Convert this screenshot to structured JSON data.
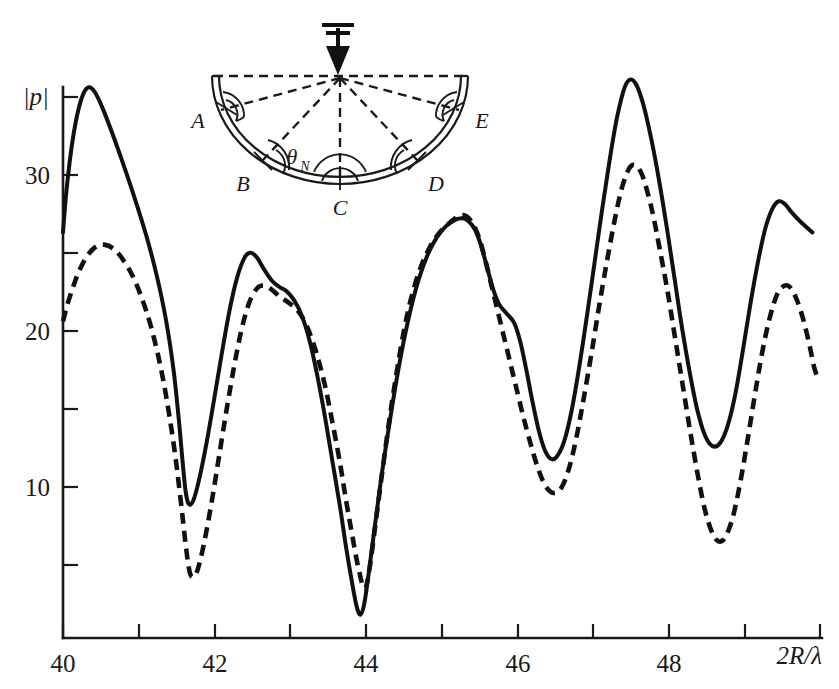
{
  "chart_data": {
    "type": "line",
    "title": "",
    "xlabel": "2R/λ",
    "ylabel": "|p|",
    "xlim": [
      40,
      50
    ],
    "ylim": [
      0,
      37
    ],
    "grid": false,
    "legend_position": "none",
    "x_ticks_major": [
      40,
      42,
      44,
      46,
      48
    ],
    "x_ticks_major_labels": [
      "40",
      "42",
      "44",
      "46",
      "48"
    ],
    "x_ticks_minor": [
      41,
      43,
      45,
      47,
      49,
      50
    ],
    "y_ticks_major": [
      10,
      20,
      30
    ],
    "y_ticks_major_labels": [
      "10",
      "20",
      "30"
    ],
    "y_ticks_minor": [
      5,
      15,
      25,
      35
    ],
    "series": [
      {
        "name": "solid",
        "style": "solid",
        "color": "#111111",
        "points": [
          [
            40.0,
            26.0
          ],
          [
            40.04,
            28.4
          ],
          [
            40.09,
            30.6
          ],
          [
            40.14,
            32.3
          ],
          [
            40.2,
            33.8
          ],
          [
            40.27,
            34.9
          ],
          [
            40.34,
            35.3
          ],
          [
            40.42,
            35.0
          ],
          [
            40.52,
            34.0
          ],
          [
            40.64,
            32.5
          ],
          [
            40.78,
            30.6
          ],
          [
            40.94,
            28.3
          ],
          [
            41.1,
            25.8
          ],
          [
            41.24,
            23.2
          ],
          [
            41.36,
            20.4
          ],
          [
            41.46,
            17.2
          ],
          [
            41.53,
            14.0
          ],
          [
            41.58,
            11.3
          ],
          [
            41.62,
            9.4
          ],
          [
            41.66,
            8.6
          ],
          [
            41.72,
            8.8
          ],
          [
            41.8,
            10.2
          ],
          [
            41.9,
            12.6
          ],
          [
            42.0,
            15.4
          ],
          [
            42.1,
            18.3
          ],
          [
            42.2,
            21.0
          ],
          [
            42.3,
            23.1
          ],
          [
            42.4,
            24.4
          ],
          [
            42.48,
            24.7
          ],
          [
            42.56,
            24.4
          ],
          [
            42.66,
            23.6
          ],
          [
            42.76,
            22.9
          ],
          [
            42.86,
            22.5
          ],
          [
            42.96,
            22.2
          ],
          [
            43.06,
            21.6
          ],
          [
            43.16,
            20.6
          ],
          [
            43.26,
            19.0
          ],
          [
            43.36,
            16.8
          ],
          [
            43.46,
            14.2
          ],
          [
            43.56,
            11.3
          ],
          [
            43.66,
            8.4
          ],
          [
            43.74,
            5.8
          ],
          [
            43.82,
            3.5
          ],
          [
            43.88,
            2.0
          ],
          [
            43.93,
            1.5
          ],
          [
            43.98,
            2.2
          ],
          [
            44.04,
            4.2
          ],
          [
            44.12,
            7.2
          ],
          [
            44.22,
            10.8
          ],
          [
            44.34,
            14.6
          ],
          [
            44.46,
            18.0
          ],
          [
            44.58,
            20.8
          ],
          [
            44.7,
            23.0
          ],
          [
            44.82,
            24.6
          ],
          [
            44.94,
            25.7
          ],
          [
            45.06,
            26.4
          ],
          [
            45.18,
            26.8
          ],
          [
            45.28,
            26.9
          ],
          [
            45.36,
            26.7
          ],
          [
            45.44,
            26.2
          ],
          [
            45.52,
            25.2
          ],
          [
            45.6,
            23.8
          ],
          [
            45.68,
            22.4
          ],
          [
            45.76,
            21.4
          ],
          [
            45.86,
            20.8
          ],
          [
            45.96,
            20.2
          ],
          [
            46.04,
            19.0
          ],
          [
            46.12,
            17.2
          ],
          [
            46.2,
            15.2
          ],
          [
            46.28,
            13.4
          ],
          [
            46.36,
            12.1
          ],
          [
            46.44,
            11.5
          ],
          [
            46.52,
            11.6
          ],
          [
            46.62,
            12.6
          ],
          [
            46.72,
            14.6
          ],
          [
            46.82,
            17.4
          ],
          [
            46.92,
            20.6
          ],
          [
            47.02,
            24.0
          ],
          [
            47.12,
            27.4
          ],
          [
            47.22,
            30.6
          ],
          [
            47.32,
            33.4
          ],
          [
            47.42,
            35.3
          ],
          [
            47.5,
            35.8
          ],
          [
            47.58,
            35.4
          ],
          [
            47.66,
            34.3
          ],
          [
            47.74,
            32.7
          ],
          [
            47.82,
            30.8
          ],
          [
            47.9,
            28.6
          ],
          [
            47.98,
            26.2
          ],
          [
            48.08,
            23.0
          ],
          [
            48.18,
            19.8
          ],
          [
            48.28,
            17.0
          ],
          [
            48.38,
            14.6
          ],
          [
            48.48,
            13.0
          ],
          [
            48.58,
            12.3
          ],
          [
            48.68,
            12.5
          ],
          [
            48.78,
            13.6
          ],
          [
            48.88,
            15.6
          ],
          [
            48.98,
            18.4
          ],
          [
            49.08,
            21.4
          ],
          [
            49.18,
            24.1
          ],
          [
            49.28,
            26.3
          ],
          [
            49.38,
            27.6
          ],
          [
            49.46,
            28.0
          ],
          [
            49.54,
            27.8
          ],
          [
            49.64,
            27.2
          ],
          [
            49.76,
            26.6
          ],
          [
            49.9,
            26.0
          ]
        ]
      },
      {
        "name": "dashed",
        "style": "dashed",
        "color": "#111111",
        "points": [
          [
            40.0,
            20.3
          ],
          [
            40.06,
            21.4
          ],
          [
            40.14,
            22.6
          ],
          [
            40.22,
            23.6
          ],
          [
            40.32,
            24.5
          ],
          [
            40.44,
            25.1
          ],
          [
            40.56,
            25.2
          ],
          [
            40.68,
            24.9
          ],
          [
            40.8,
            24.2
          ],
          [
            40.92,
            23.2
          ],
          [
            41.04,
            21.8
          ],
          [
            41.16,
            20.0
          ],
          [
            41.28,
            17.6
          ],
          [
            41.38,
            15.0
          ],
          [
            41.48,
            11.8
          ],
          [
            41.56,
            8.6
          ],
          [
            41.62,
            6.0
          ],
          [
            41.67,
            4.3
          ],
          [
            41.72,
            3.9
          ],
          [
            41.78,
            4.4
          ],
          [
            41.86,
            6.0
          ],
          [
            41.96,
            8.6
          ],
          [
            42.06,
            11.6
          ],
          [
            42.16,
            14.6
          ],
          [
            42.26,
            17.4
          ],
          [
            42.36,
            19.8
          ],
          [
            42.46,
            21.5
          ],
          [
            42.56,
            22.4
          ],
          [
            42.64,
            22.6
          ],
          [
            42.74,
            22.4
          ],
          [
            42.86,
            21.9
          ],
          [
            42.98,
            21.5
          ],
          [
            43.1,
            21.0
          ],
          [
            43.22,
            20.0
          ],
          [
            43.34,
            18.4
          ],
          [
            43.46,
            16.2
          ],
          [
            43.56,
            13.8
          ],
          [
            43.66,
            11.2
          ],
          [
            43.74,
            8.8
          ],
          [
            43.82,
            6.6
          ],
          [
            43.88,
            5.0
          ],
          [
            43.93,
            3.9
          ],
          [
            43.97,
            3.2
          ],
          [
            44.01,
            3.4
          ],
          [
            44.06,
            4.8
          ],
          [
            44.12,
            7.0
          ],
          [
            44.2,
            10.0
          ],
          [
            44.3,
            13.6
          ],
          [
            44.4,
            16.8
          ],
          [
            44.5,
            19.6
          ],
          [
            44.6,
            21.8
          ],
          [
            44.72,
            23.7
          ],
          [
            44.84,
            25.0
          ],
          [
            44.96,
            25.9
          ],
          [
            45.08,
            26.5
          ],
          [
            45.18,
            26.9
          ],
          [
            45.26,
            27.1
          ],
          [
            45.34,
            27.0
          ],
          [
            45.42,
            26.5
          ],
          [
            45.5,
            25.6
          ],
          [
            45.58,
            24.2
          ],
          [
            45.66,
            22.6
          ],
          [
            45.74,
            21.0
          ],
          [
            45.82,
            19.4
          ],
          [
            45.9,
            17.8
          ],
          [
            45.98,
            16.2
          ],
          [
            46.08,
            14.2
          ],
          [
            46.18,
            12.4
          ],
          [
            46.28,
            10.8
          ],
          [
            46.38,
            9.7
          ],
          [
            46.48,
            9.3
          ],
          [
            46.58,
            9.6
          ],
          [
            46.68,
            10.8
          ],
          [
            46.78,
            12.8
          ],
          [
            46.88,
            15.4
          ],
          [
            46.98,
            18.2
          ],
          [
            47.08,
            21.2
          ],
          [
            47.18,
            24.0
          ],
          [
            47.28,
            26.6
          ],
          [
            47.38,
            28.8
          ],
          [
            47.48,
            30.1
          ],
          [
            47.56,
            30.3
          ],
          [
            47.64,
            29.8
          ],
          [
            47.72,
            28.6
          ],
          [
            47.8,
            27.0
          ],
          [
            47.88,
            25.0
          ],
          [
            47.98,
            22.4
          ],
          [
            48.08,
            19.4
          ],
          [
            48.18,
            16.4
          ],
          [
            48.28,
            13.4
          ],
          [
            48.38,
            10.6
          ],
          [
            48.48,
            8.2
          ],
          [
            48.58,
            6.7
          ],
          [
            48.66,
            6.2
          ],
          [
            48.74,
            6.4
          ],
          [
            48.84,
            7.6
          ],
          [
            48.94,
            9.8
          ],
          [
            49.04,
            12.6
          ],
          [
            49.14,
            15.6
          ],
          [
            49.24,
            18.4
          ],
          [
            49.34,
            20.6
          ],
          [
            49.44,
            22.1
          ],
          [
            49.54,
            22.6
          ],
          [
            49.62,
            22.4
          ],
          [
            49.7,
            21.6
          ],
          [
            49.78,
            20.4
          ],
          [
            49.86,
            18.8
          ],
          [
            49.92,
            17.4
          ],
          [
            49.96,
            16.8
          ]
        ]
      }
    ]
  },
  "axes": {
    "y_axis_title": "|p|",
    "x_axis_title": "2R/λ",
    "y_labels": [
      "30",
      "20",
      "10"
    ],
    "x_labels": [
      "40",
      "42",
      "44",
      "46",
      "48"
    ]
  },
  "inset": {
    "caption": "",
    "labels": {
      "a": "A",
      "b": "B",
      "c": "C",
      "d": "D",
      "e": "E",
      "theta": "θ",
      "theta_sub": "N"
    },
    "incident_arrow": "downward-incident-wave-arrow"
  },
  "style": {
    "ink": "#111111",
    "background": "#ffffff"
  }
}
